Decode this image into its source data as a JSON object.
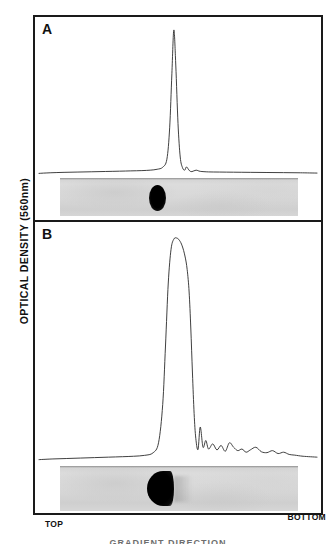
{
  "figure": {
    "y_axis_label": "OPTICAL DENSITY  (560nm)",
    "x_label_left": "TOP",
    "x_label_right": "BOTTOM",
    "bottom_caption": "GRADIENT DIRECTION",
    "panel_a_letter": "A",
    "panel_b_letter": "B",
    "colors": {
      "trace": "#2a2a2a",
      "frame": "#1a1a1a",
      "gel_background": "#d8d8d8",
      "gel_band": "#000000"
    }
  },
  "chart_data": {
    "type": "line",
    "xlabel": "",
    "ylabel": "OPTICAL DENSITY  (560nm)",
    "x_tick_labels": [
      "TOP",
      "BOTTOM"
    ],
    "xlim": [
      0,
      100
    ],
    "ylim": [
      0,
      1
    ],
    "grid": false,
    "legend": "none",
    "panels": [
      {
        "label": "A",
        "description": "Single sharp narrow peak near the middle of the gel with a small trailing shoulder; flat baseline elsewhere.",
        "peak_position_pct": 48.5,
        "peak_height_norm": 1.0,
        "peak_width_pct": 4.0,
        "shoulder_position_pct": 53.5,
        "shoulder_height_norm": 0.055,
        "baseline_norm": 0.02,
        "x": [
          0,
          4,
          9,
          14,
          19,
          24,
          29,
          33,
          37,
          40,
          42.5,
          44.5,
          46,
          47,
          47.8,
          48.5,
          49.2,
          50,
          50.8,
          51.6,
          52.4,
          53.0,
          53.6,
          54.2,
          55,
          56.5,
          58,
          61,
          65,
          70,
          76,
          82,
          88,
          94,
          100
        ],
        "y": [
          0.018,
          0.022,
          0.025,
          0.027,
          0.029,
          0.031,
          0.033,
          0.035,
          0.037,
          0.04,
          0.046,
          0.06,
          0.115,
          0.33,
          0.7,
          1.0,
          0.76,
          0.36,
          0.13,
          0.058,
          0.04,
          0.062,
          0.05,
          0.035,
          0.03,
          0.04,
          0.032,
          0.028,
          0.027,
          0.026,
          0.025,
          0.024,
          0.023,
          0.022,
          0.02
        ],
        "gel_band": {
          "center_pct": 48.0,
          "width_pct": 7.0,
          "shape": "ellipse",
          "intensity": "dark"
        }
      },
      {
        "label": "B",
        "description": "Single broad rounded peak slightly right of centre, with a noisy trailing region of several small bumps toward the bottom of the gel.",
        "peak_position_pct": 49.5,
        "peak_height_norm": 1.0,
        "peak_width_pct": 11.0,
        "baseline_norm": 0.02,
        "x": [
          0,
          5,
          10,
          15,
          20,
          25,
          30,
          34,
          38,
          41,
          43,
          44.5,
          45.5,
          46.5,
          47.5,
          48.5,
          49.5,
          50.5,
          51.5,
          52.5,
          53.3,
          54.0,
          54.6,
          55.2,
          55.8,
          56.4,
          57.2,
          58,
          59,
          60,
          61,
          62.5,
          64,
          65.5,
          67,
          68.5,
          70,
          71.5,
          73,
          74.5,
          76,
          78,
          80,
          82,
          84,
          86,
          88,
          90,
          92,
          95,
          100
        ],
        "y": [
          0.015,
          0.018,
          0.02,
          0.022,
          0.024,
          0.026,
          0.028,
          0.03,
          0.034,
          0.045,
          0.09,
          0.26,
          0.52,
          0.8,
          0.95,
          0.995,
          1.0,
          0.99,
          0.965,
          0.92,
          0.86,
          0.76,
          0.6,
          0.4,
          0.22,
          0.11,
          0.06,
          0.16,
          0.07,
          0.1,
          0.062,
          0.085,
          0.058,
          0.078,
          0.052,
          0.09,
          0.07,
          0.055,
          0.062,
          0.048,
          0.058,
          0.07,
          0.05,
          0.046,
          0.055,
          0.042,
          0.048,
          0.038,
          0.035,
          0.03,
          0.026
        ],
        "gel_band": {
          "center_pct": 48.5,
          "width_pct": 11.0,
          "shape": "d-shape",
          "intensity": "very-dark",
          "trailing_smear": true
        }
      }
    ]
  }
}
